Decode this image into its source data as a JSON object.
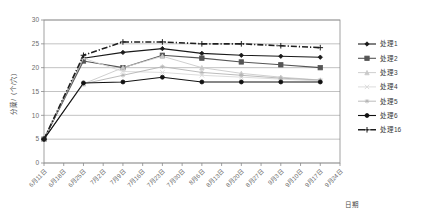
{
  "chart_data": {
    "type": "line",
    "title": "",
    "xlabel": "日期",
    "ylabel": "分蘖/（个/穴）",
    "ylim": [
      0,
      30
    ],
    "ytick_labels": [
      "0",
      "5",
      "10",
      "15",
      "20",
      "25",
      "30"
    ],
    "ytick_values": [
      0,
      5,
      10,
      15,
      20,
      25,
      30
    ],
    "grid": true,
    "legend_position": "right",
    "categories": [
      "6月11日",
      "6月18日",
      "6月25日",
      "7月2日",
      "7月9日",
      "7月16日",
      "7月23日",
      "7月30日",
      "8月6日",
      "8月13日",
      "8月20日",
      "8月27日",
      "9月3日",
      "9月10日",
      "9月17日",
      "9月24日"
    ],
    "series": [
      {
        "name": "处理1",
        "color": "#1a1a1a",
        "marker": "diamond",
        "dash": "solid",
        "values": [
          5,
          null,
          22,
          null,
          23.2,
          null,
          24,
          null,
          23,
          null,
          22.6,
          null,
          22.4,
          null,
          22.2,
          null
        ]
      },
      {
        "name": "处理2",
        "color": "#555555",
        "marker": "square",
        "dash": "solid",
        "values": [
          5,
          null,
          21.4,
          null,
          20,
          null,
          22.6,
          null,
          22,
          null,
          21.2,
          null,
          20.6,
          null,
          20,
          null
        ]
      },
      {
        "name": "处理3",
        "color": "#c9c9c9",
        "marker": "triangle",
        "dash": "solid",
        "values": [
          5,
          null,
          16.6,
          null,
          20,
          null,
          22.4,
          null,
          20,
          null,
          18.8,
          null,
          18,
          null,
          17.4,
          null
        ]
      },
      {
        "name": "处理4",
        "color": "#d8d8d8",
        "marker": "cross",
        "dash": "solid",
        "values": [
          5,
          null,
          22,
          null,
          19.2,
          null,
          19,
          null,
          18.4,
          null,
          18,
          null,
          17.6,
          null,
          17.2,
          null
        ]
      },
      {
        "name": "处理5",
        "color": "#b4b4b4",
        "marker": "asterisk",
        "dash": "solid",
        "values": [
          5,
          null,
          16.6,
          null,
          18.4,
          null,
          20.2,
          null,
          19,
          null,
          18.4,
          null,
          17.8,
          null,
          17.4,
          null
        ]
      },
      {
        "name": "处理6",
        "color": "#111111",
        "marker": "circle",
        "dash": "solid",
        "values": [
          5,
          null,
          16.8,
          null,
          17,
          null,
          18,
          null,
          17,
          null,
          17,
          null,
          17,
          null,
          17,
          null
        ]
      },
      {
        "name": "处理16",
        "color": "#1f1f1f",
        "marker": "plus",
        "dash": "dashdot",
        "values": [
          5,
          null,
          22.6,
          null,
          25.4,
          null,
          25.4,
          null,
          25,
          null,
          25,
          null,
          24.6,
          null,
          24.2,
          null
        ]
      }
    ]
  },
  "legend": {
    "items": [
      {
        "label": "处理1"
      },
      {
        "label": "处理2"
      },
      {
        "label": "处理3"
      },
      {
        "label": "处理4"
      },
      {
        "label": "处理5"
      },
      {
        "label": "处理6"
      },
      {
        "label": "处理16"
      }
    ]
  }
}
